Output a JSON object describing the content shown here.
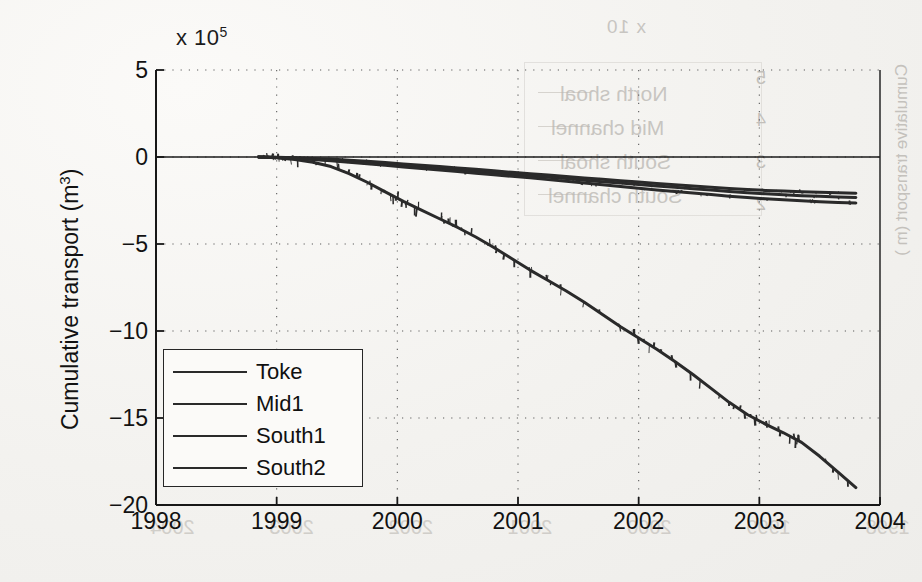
{
  "chart_data": {
    "type": "line",
    "title": "",
    "subtitle": "",
    "xlabel": "",
    "ylabel": "Cumulative transport (m3)",
    "ylabel_display": "Cumulative transport (m",
    "ylabel_sup": "3",
    "ylabel_tail": ")",
    "y_multiplier_prefix": "x 10",
    "y_multiplier_exponent": "5",
    "y_multiplier_value": 100000,
    "xlim": [
      1998,
      2004
    ],
    "ylim": [
      -20,
      5
    ],
    "xticks": [
      1998,
      1999,
      2000,
      2001,
      2002,
      2003,
      2004
    ],
    "xtick_labels": [
      "1998",
      "1999",
      "2000",
      "2001",
      "2002",
      "2003",
      "2004"
    ],
    "yticks": [
      5,
      0,
      -5,
      -10,
      -15,
      -20
    ],
    "ytick_labels": [
      "5",
      "0",
      "-5",
      "-10",
      "-15",
      "-20"
    ],
    "grid": true,
    "grid_style": "dotted",
    "legend_position": "lower-left-inside",
    "line_color": "#2a2a2a",
    "axis_color": "#1b1b1b",
    "background_color": "#f4f3f1",
    "data_start_x": 1998.85,
    "data_end_x": 2003.8,
    "series": [
      {
        "name": "Toke",
        "x": [
          1998.85,
          1999.0,
          1999.15,
          1999.3,
          1999.45,
          1999.6,
          1999.75,
          1999.9,
          2000.05,
          2000.2,
          2000.35,
          2000.5,
          2000.65,
          2000.8,
          2000.95,
          2001.1,
          2001.25,
          2001.4,
          2001.55,
          2001.7,
          2001.85,
          2002.0,
          2002.15,
          2002.3,
          2002.45,
          2002.6,
          2002.75,
          2002.9,
          2003.05,
          2003.2,
          2003.35,
          2003.5,
          2003.65,
          2003.8
        ],
        "values": [
          0.0,
          -0.05,
          -0.15,
          -0.3,
          -0.55,
          -0.95,
          -1.45,
          -2.0,
          -2.55,
          -3.05,
          -3.55,
          -4.05,
          -4.6,
          -5.2,
          -5.85,
          -6.5,
          -7.1,
          -7.7,
          -8.35,
          -9.05,
          -9.75,
          -10.4,
          -11.05,
          -11.75,
          -12.5,
          -13.3,
          -14.1,
          -14.8,
          -15.35,
          -15.85,
          -16.4,
          -17.2,
          -18.1,
          -19.0
        ]
      },
      {
        "name": "Mid1",
        "x": [
          1998.85,
          1999.0,
          1999.15,
          1999.3,
          1999.45,
          1999.6,
          1999.75,
          1999.9,
          2000.05,
          2000.2,
          2000.35,
          2000.5,
          2000.65,
          2000.8,
          2000.95,
          2001.1,
          2001.25,
          2001.4,
          2001.55,
          2001.7,
          2001.85,
          2002.0,
          2002.15,
          2002.3,
          2002.45,
          2002.6,
          2002.75,
          2002.9,
          2003.05,
          2003.2,
          2003.35,
          2003.5,
          2003.65,
          2003.8
        ],
        "values": [
          0.0,
          -0.02,
          -0.05,
          -0.08,
          -0.12,
          -0.18,
          -0.25,
          -0.32,
          -0.4,
          -0.48,
          -0.55,
          -0.63,
          -0.71,
          -0.79,
          -0.88,
          -0.96,
          -1.04,
          -1.12,
          -1.2,
          -1.28,
          -1.36,
          -1.44,
          -1.52,
          -1.6,
          -1.67,
          -1.74,
          -1.81,
          -1.87,
          -1.92,
          -1.96,
          -2.0,
          -2.03,
          -2.06,
          -2.08
        ]
      },
      {
        "name": "South1",
        "x": [
          1998.85,
          1999.0,
          1999.15,
          1999.3,
          1999.45,
          1999.6,
          1999.75,
          1999.9,
          2000.05,
          2000.2,
          2000.35,
          2000.5,
          2000.65,
          2000.8,
          2000.95,
          2001.1,
          2001.25,
          2001.4,
          2001.55,
          2001.7,
          2001.85,
          2002.0,
          2002.15,
          2002.3,
          2002.45,
          2002.6,
          2002.75,
          2002.9,
          2003.05,
          2003.2,
          2003.35,
          2003.5,
          2003.65,
          2003.8
        ],
        "values": [
          0.0,
          -0.03,
          -0.07,
          -0.12,
          -0.18,
          -0.26,
          -0.34,
          -0.42,
          -0.5,
          -0.58,
          -0.66,
          -0.74,
          -0.82,
          -0.9,
          -0.99,
          -1.08,
          -1.16,
          -1.24,
          -1.33,
          -1.42,
          -1.5,
          -1.58,
          -1.66,
          -1.74,
          -1.82,
          -1.9,
          -1.98,
          -2.05,
          -2.11,
          -2.17,
          -2.22,
          -2.26,
          -2.3,
          -2.33
        ]
      },
      {
        "name": "South2",
        "x": [
          1998.85,
          1999.0,
          1999.15,
          1999.3,
          1999.45,
          1999.6,
          1999.75,
          1999.9,
          2000.05,
          2000.2,
          2000.35,
          2000.5,
          2000.65,
          2000.8,
          2000.95,
          2001.1,
          2001.25,
          2001.4,
          2001.55,
          2001.7,
          2001.85,
          2002.0,
          2002.15,
          2002.3,
          2002.45,
          2002.6,
          2002.75,
          2002.9,
          2003.05,
          2003.2,
          2003.35,
          2003.5,
          2003.65,
          2003.8
        ],
        "values": [
          0.0,
          -0.03,
          -0.08,
          -0.14,
          -0.21,
          -0.3,
          -0.39,
          -0.48,
          -0.57,
          -0.66,
          -0.75,
          -0.84,
          -0.93,
          -1.02,
          -1.11,
          -1.2,
          -1.3,
          -1.4,
          -1.5,
          -1.6,
          -1.7,
          -1.8,
          -1.89,
          -1.98,
          -2.07,
          -2.16,
          -2.25,
          -2.33,
          -2.4,
          -2.46,
          -2.52,
          -2.57,
          -2.61,
          -2.64
        ]
      }
    ]
  },
  "legend": {
    "items": [
      {
        "label": "Toke"
      },
      {
        "label": "Mid1"
      },
      {
        "label": "South1"
      },
      {
        "label": "South2"
      }
    ]
  },
  "bleed_through": {
    "note": "faint mirrored text showing through from reverse page",
    "exponent": "x 10",
    "legend_items": [
      "North shoal",
      "Mid channel",
      "South shoal",
      "South channel"
    ],
    "ylabel": "Cumulative transport (m )",
    "xtick_labels": [
      "1998",
      "1999",
      "2000",
      "2001",
      "2002",
      "2003",
      "2004"
    ],
    "ytick_labels": [
      "5",
      "4",
      "3",
      "2",
      "1"
    ]
  }
}
